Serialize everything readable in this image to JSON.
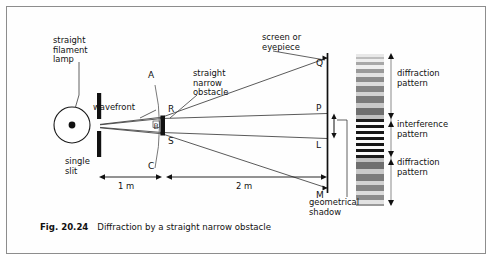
{
  "figure": {
    "caption_number": "Fig. 20.24",
    "caption_text": "Diffraction by a straight narrow obstacle",
    "border_color": "#8d8d8d",
    "background": "#fefefe"
  },
  "labels": {
    "lamp": "straight\nfilament\nlamp",
    "single_slit": "single\nslit",
    "wavefront": "wavefront",
    "obstacle": "straight\nnarrow\nobstacle",
    "screen": "screen or\neyepiece",
    "geometrical_shadow": "geometrical\nshadow",
    "diffraction_top": "diffraction\npattern",
    "interference": "interference\npattern",
    "diffraction_bottom": "diffraction\npattern"
  },
  "points": {
    "A": "A",
    "B": "B",
    "C": "C",
    "R": "R",
    "S": "S",
    "Q": "Q",
    "P": "P",
    "L": "L",
    "M": "M"
  },
  "dimensions": {
    "lamp_to_obstacle": "1 m",
    "obstacle_to_screen": "2 m"
  },
  "chart_data": {
    "type": "bar",
    "title": "Diffraction by a straight narrow obstacle",
    "xlabel": "distance along optic axis",
    "ylabel": "position on screen",
    "geometry": {
      "source": "straight filament lamp with single slit",
      "slit_to_obstacle_m": 1,
      "obstacle_to_screen_m": 2,
      "obstacle": "straight narrow obstacle at B between R and S",
      "wavefront_arc_points": [
        "A",
        "B",
        "C"
      ],
      "screen_points_top_to_bottom": [
        "Q",
        "P",
        "L",
        "M"
      ],
      "geometrical_shadow_extent": "P to L"
    },
    "regions": [
      {
        "name": "diffraction pattern",
        "span": "Q to P",
        "character": "broad grey fringes outside shadow"
      },
      {
        "name": "interference pattern",
        "span": "P to L",
        "character": "sharp black and white fringes inside geometrical shadow"
      },
      {
        "name": "diffraction pattern",
        "span": "L to M",
        "character": "broad grey fringes outside shadow"
      }
    ],
    "fringes": [
      {
        "y": 0,
        "h": 3,
        "shade": "#e8e8e8"
      },
      {
        "y": 3,
        "h": 2,
        "shade": "#bdbdbd"
      },
      {
        "y": 5,
        "h": 3,
        "shade": "#ededed"
      },
      {
        "y": 8,
        "h": 3,
        "shade": "#a8a8a8"
      },
      {
        "y": 11,
        "h": 4,
        "shade": "#efefef"
      },
      {
        "y": 15,
        "h": 4,
        "shade": "#9a9a9a"
      },
      {
        "y": 19,
        "h": 4,
        "shade": "#e2e2e2"
      },
      {
        "y": 23,
        "h": 5,
        "shade": "#8c8c8c"
      },
      {
        "y": 28,
        "h": 4,
        "shade": "#dcdcdc"
      },
      {
        "y": 32,
        "h": 6,
        "shade": "#858585"
      },
      {
        "y": 38,
        "h": 4,
        "shade": "#d2d2d2"
      },
      {
        "y": 42,
        "h": 7,
        "shade": "#7b7b7b"
      },
      {
        "y": 49,
        "h": 5,
        "shade": "#c9c9c9"
      },
      {
        "y": 54,
        "h": 7,
        "shade": "#6f6f6f"
      },
      {
        "y": 61,
        "h": 4,
        "shade": "#c0c0c0"
      },
      {
        "y": 65,
        "h": 3,
        "shade": "#1d1d1d"
      },
      {
        "y": 68,
        "h": 3,
        "shade": "#fbfbfb"
      },
      {
        "y": 71,
        "h": 3,
        "shade": "#161616"
      },
      {
        "y": 74,
        "h": 3,
        "shade": "#fbfbfb"
      },
      {
        "y": 77,
        "h": 3,
        "shade": "#161616"
      },
      {
        "y": 80,
        "h": 3,
        "shade": "#fbfbfb"
      },
      {
        "y": 83,
        "h": 3,
        "shade": "#161616"
      },
      {
        "y": 86,
        "h": 3,
        "shade": "#fbfbfb"
      },
      {
        "y": 89,
        "h": 3,
        "shade": "#161616"
      },
      {
        "y": 92,
        "h": 3,
        "shade": "#fbfbfb"
      },
      {
        "y": 95,
        "h": 3,
        "shade": "#161616"
      },
      {
        "y": 98,
        "h": 3,
        "shade": "#fbfbfb"
      },
      {
        "y": 101,
        "h": 3,
        "shade": "#1d1d1d"
      },
      {
        "y": 104,
        "h": 4,
        "shade": "#c0c0c0"
      },
      {
        "y": 108,
        "h": 7,
        "shade": "#6f6f6f"
      },
      {
        "y": 115,
        "h": 5,
        "shade": "#c9c9c9"
      },
      {
        "y": 120,
        "h": 7,
        "shade": "#7b7b7b"
      },
      {
        "y": 127,
        "h": 4,
        "shade": "#d2d2d2"
      },
      {
        "y": 131,
        "h": 6,
        "shade": "#858585"
      },
      {
        "y": 137,
        "h": 4,
        "shade": "#dcdcdc"
      },
      {
        "y": 141,
        "h": 5,
        "shade": "#8c8c8c"
      },
      {
        "y": 146,
        "h": 4,
        "shade": "#e2e2e2"
      },
      {
        "y": 150,
        "h": 2,
        "shade": "#9a9a9a"
      }
    ]
  }
}
